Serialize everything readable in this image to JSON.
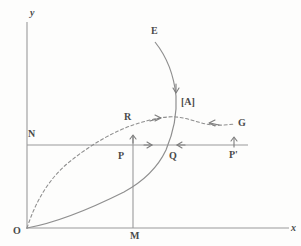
{
  "figure": {
    "colors": {
      "line": "#9a9a9a",
      "curve": "#8f8f8f",
      "label": "#4a4a4a",
      "background": "#fdfdfc"
    },
    "axes": {
      "x_label": "x",
      "y_label": "y",
      "origin_label": "O"
    },
    "labels": {
      "curve_e": "E",
      "curve_g": "G",
      "point_a": "[A]",
      "point_r": "R",
      "point_n": "N",
      "point_p": "P",
      "point_q": "Q",
      "point_p_prime": "P'",
      "point_m": "M"
    },
    "geometry": {
      "origin": [
        27,
        228
      ],
      "x_axis_end": [
        289,
        228
      ],
      "y_axis_top": [
        27,
        22
      ],
      "horizontal_line_y": 145,
      "horizontal_line_end_x": 248,
      "vertical_line_x": 133,
      "vertical_line_top_y": 136,
      "solid_curve_start": [
        27,
        228
      ],
      "solid_curve_end": [
        155,
        42
      ],
      "dashed_curve_start": [
        27,
        228
      ],
      "dashed_curve_end": [
        235,
        124
      ]
    },
    "arrows": [
      {
        "name": "solid-curve-down-arrow",
        "x": 173,
        "y": 88,
        "direction": "down"
      },
      {
        "name": "dashed-curve-right-arrow",
        "x": 155,
        "y": 119,
        "direction": "right"
      },
      {
        "name": "dashed-curve-left-arrow",
        "x": 213,
        "y": 122,
        "direction": "left"
      },
      {
        "name": "vertical-line-up-arrow",
        "x": 133,
        "y": 141,
        "direction": "up"
      },
      {
        "name": "horizontal-right-arrow",
        "x": 148,
        "y": 145,
        "direction": "right"
      },
      {
        "name": "horizontal-left-arrow",
        "x": 181,
        "y": 145,
        "direction": "left"
      },
      {
        "name": "p-prime-up-arrow",
        "x": 234,
        "y": 141,
        "direction": "up"
      }
    ]
  }
}
